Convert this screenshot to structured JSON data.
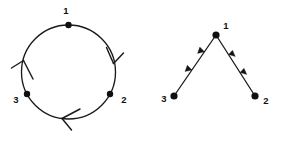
{
  "figure": {
    "background_color": "#ffffff",
    "stroke_color": "#1a1a1a",
    "node_color": "#101010",
    "label_color": "#111111"
  },
  "panels": [
    {
      "id": "cycle-graph",
      "name": "left-figure-cycle",
      "layout": "circle",
      "center": {
        "x": 68.5,
        "y": 72
      },
      "radius": 47,
      "nodes": [
        {
          "id": "1",
          "label": "1",
          "x": 68.5,
          "y": 25,
          "label_x": 66,
          "label_y": 11
        },
        {
          "id": "2",
          "label": "2",
          "x": 110,
          "y": 94,
          "label_x": 124,
          "label_y": 100
        },
        {
          "id": "3",
          "label": "3",
          "x": 27,
          "y": 94,
          "label_x": 16,
          "label_y": 100
        }
      ],
      "edges": [
        {
          "from": "1",
          "to": "2",
          "arrow_style": "open-v",
          "arrow_at": "right-side",
          "direction": "clockwise-descending"
        },
        {
          "from": "2",
          "to": "3",
          "arrow_style": "open-v",
          "arrow_at": "bottom",
          "direction": "leftward"
        },
        {
          "from": "3",
          "to": "1",
          "arrow_style": "open-v",
          "arrow_at": "left-side",
          "direction": "upward"
        }
      ],
      "node_radius": 3.2
    },
    {
      "id": "tree-graph",
      "name": "right-figure-converging-path",
      "layout": "vee",
      "nodes": [
        {
          "id": "1",
          "label": "1",
          "x": 216,
          "y": 35,
          "label_x": 226,
          "label_y": 26
        },
        {
          "id": "2",
          "label": "2",
          "x": 255,
          "y": 96,
          "label_x": 266,
          "label_y": 101
        },
        {
          "id": "3",
          "label": "3",
          "x": 174,
          "y": 96,
          "label_x": 164,
          "label_y": 99
        }
      ],
      "edges": [
        {
          "from": "3",
          "to": "1",
          "arrow_style": "solid-filled",
          "arrow_count": 2,
          "arrow_positions": [
            0.36,
            0.66
          ]
        },
        {
          "from": "2",
          "to": "1",
          "arrow_style": "solid-filled",
          "arrow_count": 2,
          "arrow_positions": [
            0.36,
            0.66
          ]
        }
      ],
      "node_radius": 3.6
    }
  ],
  "labels": {
    "node1": "1",
    "node2": "2",
    "node3": "3"
  }
}
